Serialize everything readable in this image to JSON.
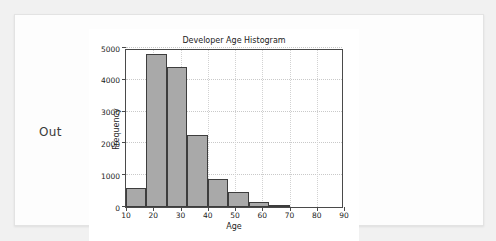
{
  "notebook": {
    "out_label": "Out"
  },
  "chart_data": {
    "type": "bar",
    "title": "Developer Age Histogram",
    "xlabel": "Age",
    "ylabel": "Frequency",
    "xlim": [
      10,
      90
    ],
    "ylim": [
      0,
      5000
    ],
    "grid": true,
    "legend": false,
    "bar_color": "#a9a9a9",
    "edge_color": "#3d3d3d",
    "bin_edges": [
      10,
      17.5,
      25,
      32.5,
      40,
      47.5,
      55,
      62.5,
      70
    ],
    "categories": [
      "10-17.5",
      "17.5-25",
      "25-32.5",
      "32.5-40",
      "40-47.5",
      "47.5-55",
      "55-62.5",
      "62.5-70"
    ],
    "values": [
      600,
      4820,
      4400,
      2250,
      880,
      480,
      170,
      40
    ],
    "xticks": [
      10,
      20,
      30,
      40,
      50,
      60,
      70,
      80,
      90
    ],
    "xtick_labels": [
      "10",
      "20",
      "30",
      "40",
      "50",
      "60",
      "70",
      "80",
      "90"
    ],
    "yticks": [
      0,
      1000,
      2000,
      3000,
      4000,
      5000
    ],
    "ytick_labels": [
      "0",
      "1000",
      "2000",
      "3000",
      "4000",
      "5000"
    ]
  }
}
